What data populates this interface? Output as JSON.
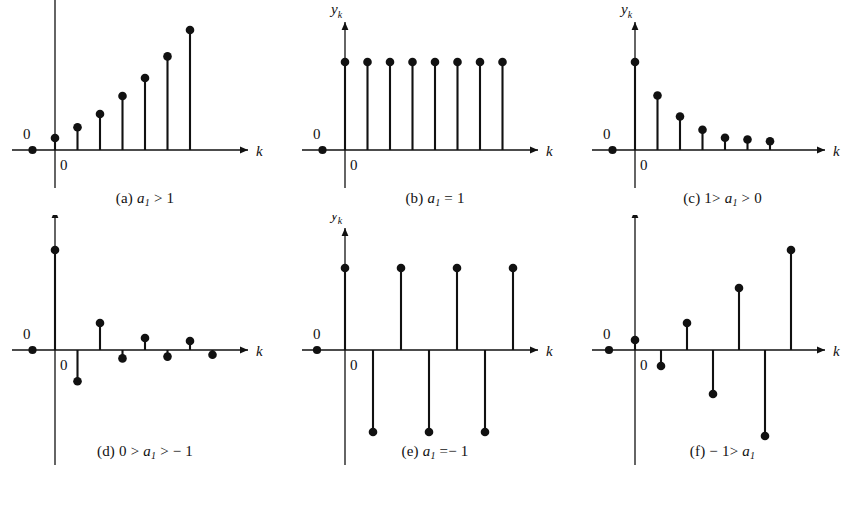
{
  "figure": {
    "background": "#ffffff",
    "ink": "#111111",
    "axis_labels": {
      "y": "y",
      "y_sub": "k",
      "x": "k"
    },
    "origin_label": "0",
    "left_label": "0"
  },
  "panels": [
    {
      "id": "a",
      "caption_prefix": "(a)",
      "caption_var": "a",
      "caption_sub": "1",
      "caption_rest": "> 1",
      "caption_plain": "(a) a1 > 1",
      "description": "growing exponential, all positive",
      "pre_dot_k": -1,
      "stems": [
        {
          "k": 0,
          "y": 0.1
        },
        {
          "k": 1,
          "y": 0.19
        },
        {
          "k": 2,
          "y": 0.3
        },
        {
          "k": 3,
          "y": 0.45
        },
        {
          "k": 4,
          "y": 0.6
        },
        {
          "k": 5,
          "y": 0.78
        },
        {
          "k": 6,
          "y": 1.0
        }
      ]
    },
    {
      "id": "b",
      "caption_prefix": "(b)",
      "caption_var": "a",
      "caption_sub": "1",
      "caption_rest": "= 1",
      "caption_plain": "(b) a1 = 1",
      "description": "constant unit sequence",
      "pre_dot_k": -1,
      "stems": [
        {
          "k": 0,
          "y": 1.0
        },
        {
          "k": 1,
          "y": 1.0
        },
        {
          "k": 2,
          "y": 1.0
        },
        {
          "k": 3,
          "y": 1.0
        },
        {
          "k": 4,
          "y": 1.0
        },
        {
          "k": 5,
          "y": 1.0
        },
        {
          "k": 6,
          "y": 1.0
        },
        {
          "k": 7,
          "y": 1.0
        }
      ]
    },
    {
      "id": "c",
      "caption_prefix": "(c)",
      "caption_var": "a",
      "caption_sub": "1",
      "caption_rest": "",
      "caption_lead": "1>",
      "caption_tail": "> 0",
      "caption_plain": "(c) 1> a1 > 0",
      "description": "decaying exponential, all positive",
      "pre_dot_k": -1,
      "stems": [
        {
          "k": 0,
          "y": 1.0
        },
        {
          "k": 1,
          "y": 0.62
        },
        {
          "k": 2,
          "y": 0.38
        },
        {
          "k": 3,
          "y": 0.23
        },
        {
          "k": 4,
          "y": 0.14
        },
        {
          "k": 5,
          "y": 0.12
        },
        {
          "k": 6,
          "y": 0.1
        }
      ]
    },
    {
      "id": "d",
      "caption_prefix": "(d)",
      "caption_var": "a",
      "caption_sub": "1",
      "caption_lead": "0 >",
      "caption_tail": "> − 1",
      "caption_plain": "(d) 0 > a1 > -1",
      "description": "alternating decaying exponential",
      "pre_dot_k": -1,
      "stems": [
        {
          "k": 0,
          "y": 1.0
        },
        {
          "k": 1,
          "y": -0.52
        },
        {
          "k": 2,
          "y": 0.27
        },
        {
          "k": 3,
          "y": -0.14
        },
        {
          "k": 4,
          "y": 0.12
        },
        {
          "k": 5,
          "y": -0.11
        },
        {
          "k": 6,
          "y": 0.09
        },
        {
          "k": 7,
          "y": -0.08
        }
      ]
    },
    {
      "id": "e",
      "caption_prefix": "(e)",
      "caption_var": "a",
      "caption_sub": "1",
      "caption_rest": "=− 1",
      "caption_plain": "(e) a1 = -1",
      "description": "alternating constant amplitude",
      "pre_dot_k": -1,
      "stems": [
        {
          "k": 0,
          "y": 1.0
        },
        {
          "k": 1,
          "y": -1.0
        },
        {
          "k": 2,
          "y": 1.0
        },
        {
          "k": 3,
          "y": -1.0
        },
        {
          "k": 4,
          "y": 1.0
        },
        {
          "k": 5,
          "y": -1.0
        },
        {
          "k": 6,
          "y": 1.0
        }
      ]
    },
    {
      "id": "f",
      "caption_prefix": "(f)",
      "caption_var": "a",
      "caption_sub": "1",
      "caption_lead": "− 1>",
      "caption_tail": "",
      "caption_plain": "(f) -1> a1",
      "description": "alternating growing exponential",
      "pre_dot_k": -1,
      "stems": [
        {
          "k": 0,
          "y": 0.1
        },
        {
          "k": 1,
          "y": -0.16
        },
        {
          "k": 2,
          "y": 0.27
        },
        {
          "k": 3,
          "y": -0.44
        },
        {
          "k": 4,
          "y": 0.62
        },
        {
          "k": 5,
          "y": -0.86
        },
        {
          "k": 6,
          "y": 1.0
        }
      ]
    }
  ],
  "chart_data": {
    "type": "scatter",
    "title": "",
    "xlabel": "k",
    "ylabel": "y_k",
    "subplots": [
      {
        "label": "(a)",
        "condition": "a1 > 1",
        "x": [
          -1,
          0,
          1,
          2,
          3,
          4,
          5,
          6
        ],
        "y": [
          0,
          0.1,
          0.19,
          0.3,
          0.45,
          0.6,
          0.78,
          1.0
        ]
      },
      {
        "label": "(b)",
        "condition": "a1 = 1",
        "x": [
          -1,
          0,
          1,
          2,
          3,
          4,
          5,
          6,
          7
        ],
        "y": [
          0,
          1,
          1,
          1,
          1,
          1,
          1,
          1,
          1
        ]
      },
      {
        "label": "(c)",
        "condition": "1 > a1 > 0",
        "x": [
          -1,
          0,
          1,
          2,
          3,
          4,
          5,
          6
        ],
        "y": [
          0,
          1.0,
          0.62,
          0.38,
          0.23,
          0.14,
          0.12,
          0.1
        ]
      },
      {
        "label": "(d)",
        "condition": "0 > a1 > -1",
        "x": [
          -1,
          0,
          1,
          2,
          3,
          4,
          5,
          6,
          7
        ],
        "y": [
          0,
          1.0,
          -0.52,
          0.27,
          -0.14,
          0.12,
          -0.11,
          0.09,
          -0.08
        ]
      },
      {
        "label": "(e)",
        "condition": "a1 = -1",
        "x": [
          -1,
          0,
          1,
          2,
          3,
          4,
          5,
          6
        ],
        "y": [
          0,
          1,
          -1,
          1,
          -1,
          1,
          -1,
          1
        ]
      },
      {
        "label": "(f)",
        "condition": "-1 > a1",
        "x": [
          -1,
          0,
          1,
          2,
          3,
          4,
          5,
          6
        ],
        "y": [
          0,
          0.1,
          -0.16,
          0.27,
          -0.44,
          0.62,
          -0.86,
          1.0
        ]
      }
    ]
  }
}
